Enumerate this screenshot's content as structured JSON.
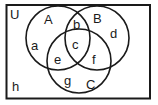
{
  "diagram": {
    "type": "venn-3-set",
    "universe_label": "U",
    "sets": [
      {
        "name": "A",
        "cx": 58,
        "cy": 38,
        "r": 32,
        "label_x": 48,
        "label_y": 24
      },
      {
        "name": "B",
        "cx": 97,
        "cy": 38,
        "r": 32,
        "label_x": 97,
        "label_y": 23
      },
      {
        "name": "C",
        "cx": 79,
        "cy": 61,
        "r": 32,
        "label_x": 90,
        "label_y": 89
      }
    ],
    "regions": [
      {
        "label": "a",
        "x": 34,
        "y": 50
      },
      {
        "label": "b",
        "x": 77,
        "y": 29
      },
      {
        "label": "c",
        "x": 75,
        "y": 50
      },
      {
        "label": "d",
        "x": 114,
        "y": 37
      },
      {
        "label": "e",
        "x": 58,
        "y": 63
      },
      {
        "label": "f",
        "x": 94,
        "y": 63
      },
      {
        "label": "g",
        "x": 68,
        "y": 85
      },
      {
        "label": "h",
        "x": 15,
        "y": 90
      }
    ],
    "stroke_color": "#1a1a1a",
    "background": "#ffffff"
  }
}
